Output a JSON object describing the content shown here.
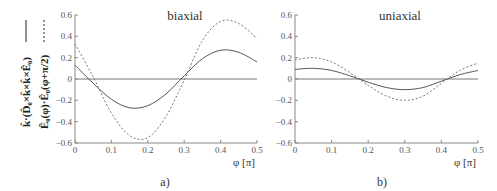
{
  "ylabel": {
    "line1": "k̂·(D̂₀×k̂×k̂×Ê₀)",
    "line1_style": "solid",
    "line2": "Ê₀(φ)·Ê₀(φ+π/2)",
    "line2_style": "dashed"
  },
  "chart_data": [
    {
      "type": "line",
      "panel": "a)",
      "title": "biaxial",
      "xlabel": "φ [π]",
      "ylabel": "k̂·(D̂₀×k̂×k̂×Ê₀) (solid); Ê₀(φ)·Ê₀(φ+π/2) (dashed)",
      "xlim": [
        0,
        0.5
      ],
      "ylim": [
        -0.6,
        0.6
      ],
      "xticks": [
        "0",
        "0.1",
        "0.2",
        "0.3",
        "0.4",
        "0.5"
      ],
      "yticks": [
        "0.6",
        "0.4",
        "0.2",
        "0",
        "-0.2",
        "-0.4",
        "-0.6"
      ],
      "grid": false,
      "x": [
        0,
        0.05,
        0.1,
        0.15,
        0.2,
        0.25,
        0.3,
        0.35,
        0.4,
        0.45,
        0.5
      ],
      "series": [
        {
          "name": "k̂·(D̂₀×k̂×k̂×Ê₀)",
          "style": "solid",
          "values": [
            0.13,
            -0.04,
            -0.19,
            -0.27,
            -0.25,
            -0.14,
            0.03,
            0.19,
            0.27,
            0.25,
            0.16
          ]
        },
        {
          "name": "Ê₀(φ)·Ê₀(φ+π/2)",
          "style": "dashed",
          "values": [
            0.33,
            0.02,
            -0.32,
            -0.53,
            -0.55,
            -0.35,
            -0.01,
            0.36,
            0.54,
            0.52,
            0.38
          ]
        }
      ]
    },
    {
      "type": "line",
      "panel": "b)",
      "title": "uniaxial",
      "xlabel": "φ [π]",
      "xlim": [
        0,
        0.5
      ],
      "ylim": [
        -0.6,
        0.6
      ],
      "xticks": [
        "0",
        "0.1",
        "0.2",
        "0.3",
        "0.4",
        "0.5"
      ],
      "yticks": [
        "0.6",
        "0.4",
        "0.2",
        "0",
        "-0.2",
        "-0.4",
        "-0.6"
      ],
      "grid": false,
      "x": [
        0,
        0.05,
        0.1,
        0.15,
        0.2,
        0.25,
        0.3,
        0.35,
        0.4,
        0.45,
        0.5
      ],
      "series": [
        {
          "name": "k̂·(D̂₀×k̂×k̂×Ê₀)",
          "style": "solid",
          "values": [
            0.09,
            0.1,
            0.08,
            0.03,
            -0.03,
            -0.08,
            -0.1,
            -0.08,
            -0.02,
            0.04,
            0.08
          ]
        },
        {
          "name": "Ê₀(φ)·Ê₀(φ+π/2)",
          "style": "dashed",
          "values": [
            0.18,
            0.2,
            0.16,
            0.06,
            -0.06,
            -0.16,
            -0.2,
            -0.16,
            -0.04,
            0.08,
            0.15
          ]
        }
      ]
    }
  ]
}
